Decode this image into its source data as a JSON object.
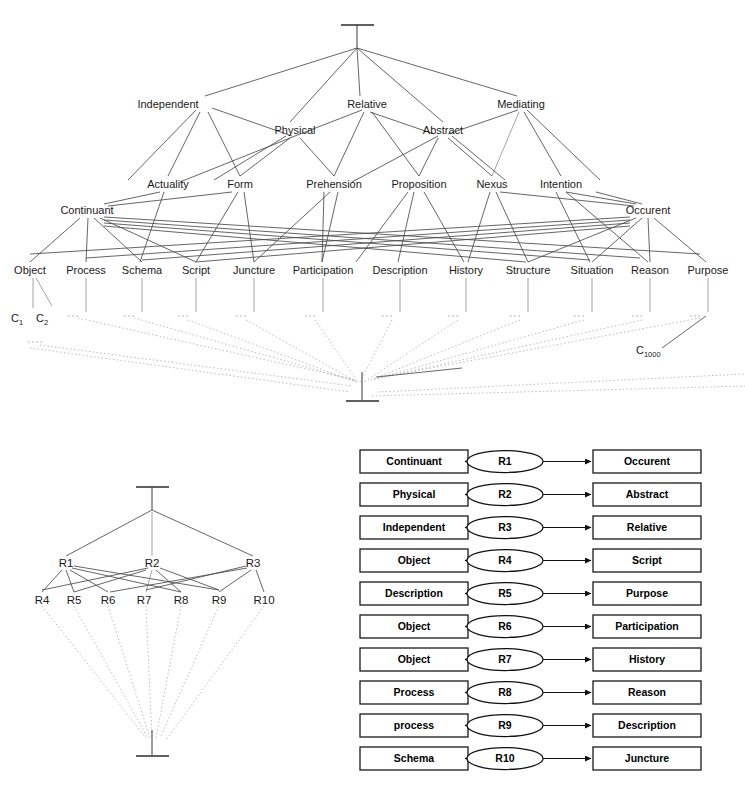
{
  "figure": {
    "top_symbol": "T",
    "bottom_symbol": "L"
  },
  "lattice_upper": {
    "top_node": {
      "name": "universal-top",
      "x": 357,
      "y": 30
    },
    "bottom_node": {
      "name": "universal-bottom",
      "x": 362,
      "y": 388
    },
    "tier1": [
      {
        "label": "Independent",
        "x": 205,
        "y": 104
      },
      {
        "label": "Relative",
        "x": 367,
        "y": 104
      },
      {
        "label": "Mediating",
        "x": 521,
        "y": 104
      }
    ],
    "tier2": [
      {
        "label": "Physical",
        "x": 295,
        "y": 130
      },
      {
        "label": "Abstract",
        "x": 443,
        "y": 130
      }
    ],
    "tier3": [
      {
        "label": "Actuality",
        "x": 168,
        "y": 184
      },
      {
        "label": "Form",
        "x": 240,
        "y": 184
      },
      {
        "label": "Prehension",
        "x": 334,
        "y": 184
      },
      {
        "label": "Proposition",
        "x": 419,
        "y": 184
      },
      {
        "label": "Nexus",
        "x": 492,
        "y": 184
      },
      {
        "label": "Intention",
        "x": 561,
        "y": 184
      }
    ],
    "tier4": [
      {
        "label": "Continuant",
        "x": 87,
        "y": 210
      },
      {
        "label": "Occurent",
        "x": 648,
        "y": 210
      }
    ],
    "leaves": [
      {
        "label": "Object",
        "x": 25,
        "y": 270
      },
      {
        "label": "Process",
        "x": 82,
        "y": 270
      },
      {
        "label": "Schema",
        "x": 139,
        "y": 270
      },
      {
        "label": "Script",
        "x": 192,
        "y": 270
      },
      {
        "label": "Juncture",
        "x": 249,
        "y": 270
      },
      {
        "label": "Participation",
        "x": 318,
        "y": 270
      },
      {
        "label": "Description",
        "x": 397,
        "y": 270
      },
      {
        "label": "History",
        "x": 464,
        "y": 270
      },
      {
        "label": "Structure",
        "x": 524,
        "y": 270
      },
      {
        "label": "Situation",
        "x": 588,
        "y": 270
      },
      {
        "label": "Reason",
        "x": 645,
        "y": 270
      },
      {
        "label": "Purpose",
        "x": 703,
        "y": 270
      }
    ],
    "instances": [
      {
        "base": "C",
        "sub": "1",
        "x": 15,
        "y": 318
      },
      {
        "base": "C",
        "sub": "2",
        "x": 40,
        "y": 318
      },
      {
        "base": "C",
        "sub": "1000",
        "x": 640,
        "y": 354
      }
    ]
  },
  "lattice_lower": {
    "top_node": {
      "name": "relation-top",
      "x": 152,
      "y": 492
    },
    "bottom_node": {
      "name": "relation-bottom",
      "x": 152,
      "y": 747
    },
    "tier1": [
      {
        "label": "R1",
        "x": 66,
        "y": 563
      },
      {
        "label": "R2",
        "x": 152,
        "y": 563
      },
      {
        "label": "R3",
        "x": 253,
        "y": 563
      }
    ],
    "tier2": [
      {
        "label": "R4",
        "x": 42,
        "y": 600
      },
      {
        "label": "R5",
        "x": 74,
        "y": 600
      },
      {
        "label": "R6",
        "x": 108,
        "y": 600
      },
      {
        "label": "R7",
        "x": 144,
        "y": 600
      },
      {
        "label": "R8",
        "x": 181,
        "y": 600
      },
      {
        "label": "R9",
        "x": 219,
        "y": 600
      },
      {
        "label": "R10",
        "x": 264,
        "y": 600
      }
    ]
  },
  "relation_table": {
    "rows": [
      {
        "source": "Continuant",
        "relation": "R1",
        "target": "Occurent"
      },
      {
        "source": "Physical",
        "relation": "R2",
        "target": "Abstract"
      },
      {
        "source": "Independent",
        "relation": "R3",
        "target": "Relative"
      },
      {
        "source": "Object",
        "relation": "R4",
        "target": "Script"
      },
      {
        "source": "Description",
        "relation": "R5",
        "target": "Purpose"
      },
      {
        "source": "Object",
        "relation": "R6",
        "target": "Participation"
      },
      {
        "source": "Object",
        "relation": "R7",
        "target": "History"
      },
      {
        "source": "Process",
        "relation": "R8",
        "target": "Reason"
      },
      {
        "source": "process",
        "relation": "R9",
        "target": "Description"
      },
      {
        "source": "Schema",
        "relation": "R10",
        "target": "Juncture"
      }
    ]
  },
  "colors": {
    "background": "#ffffff",
    "ink": "#111111",
    "edge": "#4a4a4a",
    "edge_dotted": "#9a9a9a"
  }
}
